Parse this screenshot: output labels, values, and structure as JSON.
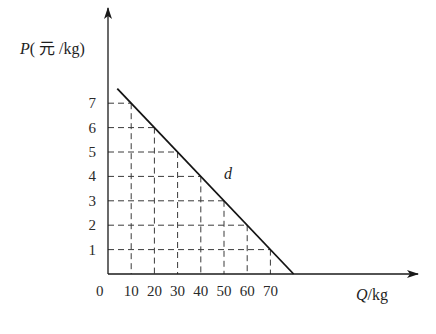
{
  "chart_data": {
    "type": "line",
    "title": "",
    "ylabel": "P(元/kg)",
    "ylabel_parts": {
      "var": "P",
      "unit": "( 元 /kg)"
    },
    "xlabel": "Q/kg",
    "xlabel_parts": {
      "var": "Q",
      "unit": "/kg"
    },
    "origin_label": "0",
    "xlim": [
      0,
      80
    ],
    "ylim": [
      0,
      8
    ],
    "x_ticks": [
      10,
      20,
      30,
      40,
      50,
      60,
      70
    ],
    "y_ticks": [
      1,
      2,
      3,
      4,
      5,
      6,
      7
    ],
    "grid": "dashed reference lines from each tick to the demand curve",
    "legend": "none",
    "series": [
      {
        "name": "d",
        "label": "d",
        "equation": "P = 8 - Q/10",
        "x": [
          4,
          10,
          20,
          30,
          40,
          50,
          60,
          70,
          80
        ],
        "y": [
          7.6,
          7,
          6,
          5,
          4,
          3,
          2,
          1,
          0
        ]
      }
    ],
    "annotations": [
      {
        "text": "d",
        "x": 45,
        "y": 4.3,
        "style": "italic"
      }
    ],
    "reference_points": [
      {
        "q": 10,
        "p": 7
      },
      {
        "q": 20,
        "p": 6
      },
      {
        "q": 30,
        "p": 5
      },
      {
        "q": 40,
        "p": 4
      },
      {
        "q": 50,
        "p": 3
      },
      {
        "q": 60,
        "p": 2
      },
      {
        "q": 70,
        "p": 1
      }
    ]
  },
  "colors": {
    "axis": "#1a1a1a",
    "curve": "#141414",
    "dashed": "#3a3a3a",
    "text": "#222222"
  }
}
